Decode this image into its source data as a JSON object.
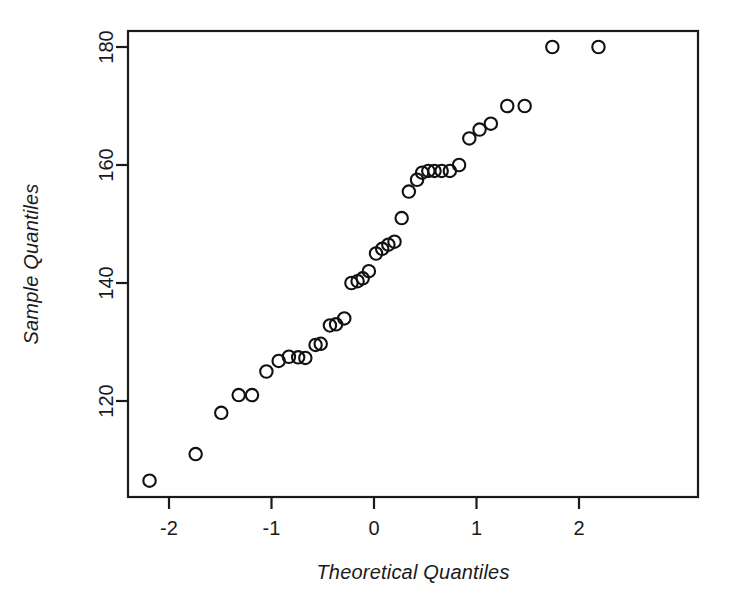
{
  "figure": {
    "title": "",
    "background_color": "#ffffff",
    "foreground_color": "#111111"
  },
  "axes": {
    "x_title": "Theoretical Quantiles",
    "y_title": "Sample Quantiles",
    "x_ticks": [
      "-2",
      "-1",
      "0",
      "1",
      "2"
    ],
    "y_ticks": [
      "120",
      "140",
      "160",
      "180"
    ]
  },
  "chart_data": {
    "type": "scatter",
    "title": "",
    "xlabel": "Theoretical Quantiles",
    "ylabel": "Sample Quantiles",
    "xlim": [
      -2.4,
      2.4
    ],
    "ylim": [
      104,
      183
    ],
    "xticks": [
      -2,
      -1,
      0,
      1,
      2
    ],
    "yticks": [
      120,
      140,
      160,
      180
    ],
    "grid": false,
    "legend": false,
    "marker": "open-circle",
    "marker_color": "#111111",
    "series": [
      {
        "name": "sample quantiles",
        "x": [
          -2.19,
          -1.74,
          -1.49,
          -1.32,
          -1.19,
          -1.05,
          -0.93,
          -0.83,
          -0.74,
          -0.67,
          -0.57,
          -0.52,
          -0.43,
          -0.37,
          -0.29,
          -0.22,
          -0.16,
          -0.11,
          -0.05,
          0.02,
          0.08,
          0.14,
          0.2,
          0.27,
          0.34,
          0.42,
          0.47,
          0.53,
          0.59,
          0.66,
          0.74,
          0.83,
          0.93,
          1.03,
          1.14,
          1.3,
          1.47,
          1.74,
          2.19
        ],
        "y": [
          106.5,
          111.0,
          118.0,
          121.0,
          121.0,
          125.0,
          126.8,
          127.5,
          127.4,
          127.3,
          129.5,
          129.7,
          132.8,
          133.0,
          134.0,
          140.0,
          140.3,
          140.8,
          142.0,
          145.0,
          145.8,
          146.5,
          147.0,
          151.0,
          155.5,
          157.5,
          158.7,
          159.0,
          159.0,
          159.0,
          159.0,
          160.0,
          164.5,
          166.0,
          167.0,
          170.0,
          170.0,
          180.0,
          180.0
        ]
      }
    ]
  },
  "geometry": {
    "plot_left": 128,
    "plot_right": 698,
    "plot_top": 31,
    "plot_bottom": 497,
    "x_pixel_per_unit": 102.5,
    "x_zero_pixel": 374,
    "y_pixel_per_unit": 5.9,
    "y_ref_value": 120,
    "y_ref_pixel": 401,
    "marker_radius": 6.2
  }
}
